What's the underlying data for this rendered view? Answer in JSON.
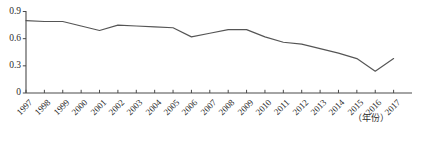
{
  "chart_data": {
    "type": "line",
    "title": "",
    "subtitle": "",
    "xlabel": "（年份）",
    "ylabel": "",
    "categories": [
      "1997",
      "1998",
      "1999",
      "2000",
      "2001",
      "2002",
      "2003",
      "2004",
      "2005",
      "2006",
      "2007",
      "2008",
      "2009",
      "2010",
      "2011",
      "2012",
      "2013",
      "2014",
      "2015",
      "2016",
      "2017"
    ],
    "values": [
      0.8,
      0.79,
      0.79,
      0.74,
      0.69,
      0.75,
      0.74,
      0.73,
      0.72,
      0.62,
      0.66,
      0.7,
      0.7,
      0.62,
      0.56,
      0.54,
      0.49,
      0.44,
      0.38,
      0.24,
      0.38
    ],
    "series": [
      {
        "name": "",
        "values": [
          0.8,
          0.79,
          0.79,
          0.74,
          0.69,
          0.75,
          0.74,
          0.73,
          0.72,
          0.62,
          0.66,
          0.7,
          0.7,
          0.62,
          0.56,
          0.54,
          0.49,
          0.44,
          0.38,
          0.24,
          0.38
        ]
      }
    ],
    "ylim": [
      0,
      0.9
    ],
    "yticks": [
      "0",
      "0.3",
      "0.6",
      "0.9"
    ],
    "ytick_values": [
      0,
      0.3,
      0.6,
      0.9
    ],
    "grid": false,
    "legend": "none",
    "line_color": "#555555",
    "axis_color": "#4a4a4a",
    "background_color": "#ffffff",
    "markers": false
  },
  "axis": {
    "x_unit_label": "（年份）"
  }
}
